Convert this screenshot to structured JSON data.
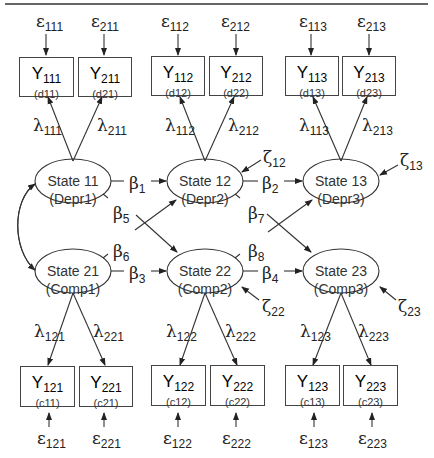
{
  "diagram": {
    "type": "latent state-trait SEM path diagram",
    "indicators_top": [
      {
        "var": "Y",
        "sub": "111",
        "code": "(d11)",
        "error": "ε",
        "error_sub": "111"
      },
      {
        "var": "Y",
        "sub": "211",
        "code": "(d21)",
        "error": "ε",
        "error_sub": "211"
      },
      {
        "var": "Y",
        "sub": "112",
        "code": "(d12)",
        "error": "ε",
        "error_sub": "112"
      },
      {
        "var": "Y",
        "sub": "212",
        "code": "(d22)",
        "error": "ε",
        "error_sub": "212"
      },
      {
        "var": "Y",
        "sub": "113",
        "code": "(d13)",
        "error": "ε",
        "error_sub": "113"
      },
      {
        "var": "Y",
        "sub": "213",
        "code": "(d23)",
        "error": "ε",
        "error_sub": "213"
      }
    ],
    "indicators_bottom": [
      {
        "var": "Y",
        "sub": "121",
        "code": "(c11)",
        "error": "ε",
        "error_sub": "121"
      },
      {
        "var": "Y",
        "sub": "221",
        "code": "(c21)",
        "error": "ε",
        "error_sub": "221"
      },
      {
        "var": "Y",
        "sub": "122",
        "code": "(c12)",
        "error": "ε",
        "error_sub": "122"
      },
      {
        "var": "Y",
        "sub": "222",
        "code": "(c22)",
        "error": "ε",
        "error_sub": "222"
      },
      {
        "var": "Y",
        "sub": "123",
        "code": "(c13)",
        "error": "ε",
        "error_sub": "123"
      },
      {
        "var": "Y",
        "sub": "223",
        "code": "(c23)",
        "error": "ε",
        "error_sub": "223"
      }
    ],
    "latents_top": [
      {
        "name": "State 11",
        "label": "(Depr1)"
      },
      {
        "name": "State 12",
        "label": "(Depr2)"
      },
      {
        "name": "State 13",
        "label": "(Depr3)"
      }
    ],
    "latents_bottom": [
      {
        "name": "State 21",
        "label": "(Comp1)"
      },
      {
        "name": "State 22",
        "label": "(Comp2)"
      },
      {
        "name": "State 23",
        "label": "(Comp3)"
      }
    ],
    "loadings_top": [
      {
        "sym": "λ",
        "sub": "111"
      },
      {
        "sym": "λ",
        "sub": "211"
      },
      {
        "sym": "λ",
        "sub": "112"
      },
      {
        "sym": "λ",
        "sub": "212"
      },
      {
        "sym": "λ",
        "sub": "113"
      },
      {
        "sym": "λ",
        "sub": "213"
      }
    ],
    "loadings_bottom": [
      {
        "sym": "λ",
        "sub": "121"
      },
      {
        "sym": "λ",
        "sub": "221"
      },
      {
        "sym": "λ",
        "sub": "122"
      },
      {
        "sym": "λ",
        "sub": "222"
      },
      {
        "sym": "λ",
        "sub": "123"
      },
      {
        "sym": "λ",
        "sub": "223"
      }
    ],
    "betas": [
      {
        "sym": "β",
        "sub": "1"
      },
      {
        "sym": "β",
        "sub": "2"
      },
      {
        "sym": "β",
        "sub": "3"
      },
      {
        "sym": "β",
        "sub": "4"
      },
      {
        "sym": "β",
        "sub": "5"
      },
      {
        "sym": "β",
        "sub": "6"
      },
      {
        "sym": "β",
        "sub": "7"
      },
      {
        "sym": "β",
        "sub": "8"
      }
    ],
    "disturbances": [
      {
        "sym": "ζ",
        "sub": "12"
      },
      {
        "sym": "ζ",
        "sub": "13"
      },
      {
        "sym": "ζ",
        "sub": "22"
      },
      {
        "sym": "ζ",
        "sub": "23"
      }
    ]
  }
}
